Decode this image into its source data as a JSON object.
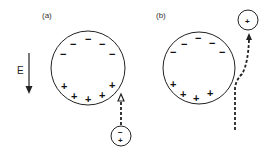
{
  "panels": [
    {
      "label": "(a)",
      "field_label": "E",
      "big_circle": {
        "top_charges": [
          "−",
          "−",
          "−",
          "−",
          "−"
        ],
        "bottom_charges": [
          "+",
          "+",
          "+",
          "+",
          "+"
        ]
      },
      "small_particle": {
        "charges": [
          "−",
          "+"
        ]
      },
      "path": "straight dashed arrow approaching sphere from below"
    },
    {
      "label": "(b)",
      "big_circle": {
        "top_charges": [
          "−",
          "−",
          "−",
          "−",
          "−"
        ],
        "bottom_charges": [
          "+",
          "+",
          "+",
          "+"
        ]
      },
      "small_particle": {
        "charges": [
          "+"
        ]
      },
      "path": "dashed trajectory deflected past sphere upward-right"
    }
  ],
  "colors": {
    "stroke": "#222222",
    "background": "#ffffff"
  }
}
